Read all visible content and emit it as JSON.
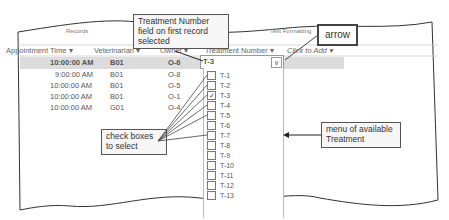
{
  "ribbon": {
    "records_label": "Records",
    "text_formatting_label": "Text Formatting"
  },
  "grid": {
    "headers": {
      "appointment_time": "Appointment Time",
      "veterinarian": "Veterinarian",
      "owner": "Owner",
      "treatment_number": "Treatment Number",
      "click_to_add": "Click to Add"
    },
    "sort_glyph": "▾",
    "rows": [
      {
        "time": "10:00:00 AM",
        "vet": "B01",
        "owner": "O-6"
      },
      {
        "time": "9:00:00 AM",
        "vet": "B01",
        "owner": "O-8"
      },
      {
        "time": "10:00:00 AM",
        "vet": "B01",
        "owner": "O-5"
      },
      {
        "time": "10:00:00 AM",
        "vet": "B01",
        "owner": "O-1"
      },
      {
        "time": "10:00:00 AM",
        "vet": "G01",
        "owner": "O-4"
      }
    ]
  },
  "dropdown": {
    "value": "T-3",
    "arrow_glyph": "∨",
    "items": [
      {
        "label": "T-1",
        "checked": false
      },
      {
        "label": "T-2",
        "checked": false
      },
      {
        "label": "T-3",
        "checked": true
      },
      {
        "label": "T-4",
        "checked": false
      },
      {
        "label": "T-5",
        "checked": false
      },
      {
        "label": "T-6",
        "checked": false
      },
      {
        "label": "T-7",
        "checked": false
      },
      {
        "label": "T-8",
        "checked": false
      },
      {
        "label": "T-9",
        "checked": false
      },
      {
        "label": "T-10",
        "checked": false
      },
      {
        "label": "T-11",
        "checked": false
      },
      {
        "label": "T-12",
        "checked": false
      },
      {
        "label": "T-13",
        "checked": false
      }
    ]
  },
  "callouts": {
    "field_selected": "Treatment Number field on first record selected",
    "arrow": "arrow",
    "check_boxes": "check boxes to select",
    "menu": "menu of available Treatment"
  }
}
